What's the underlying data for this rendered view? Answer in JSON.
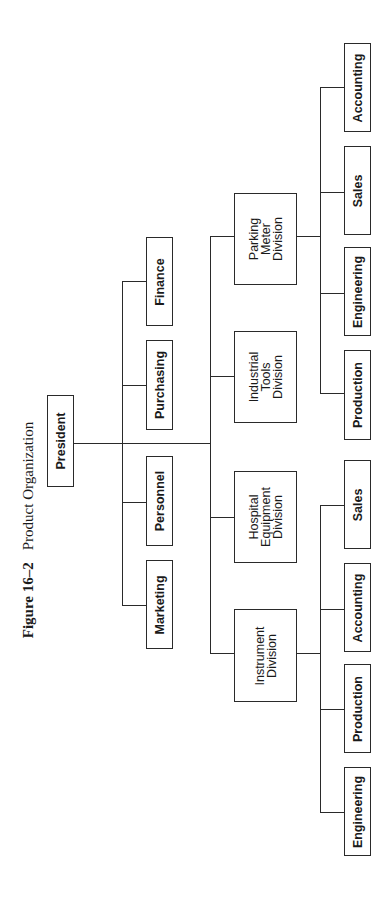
{
  "caption": {
    "figure_number": "Figure 16–2",
    "title": "Product Organization"
  },
  "chart": {
    "root": "President",
    "staff": [
      "Marketing",
      "Personnel",
      "Purchasing",
      "Finance"
    ],
    "divisions": [
      {
        "name": "Instrument\nDivision",
        "departments": [
          "Engineering",
          "Production",
          "Accounting",
          "Sales"
        ]
      },
      {
        "name": "Hospital\nEquipment\nDivision",
        "departments": []
      },
      {
        "name": "Industrial\nTools\nDivision",
        "departments": []
      },
      {
        "name": "Parking\nMeter\nDivision",
        "departments": [
          "Production",
          "Engineering",
          "Sales",
          "Accounting"
        ]
      }
    ]
  },
  "colors": {
    "line": "#2a2a2a",
    "background": "#ffffff"
  }
}
